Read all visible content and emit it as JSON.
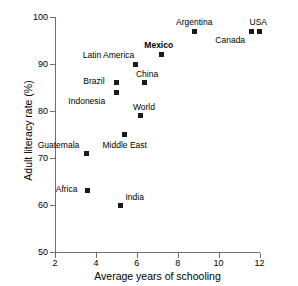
{
  "chart_data": {
    "type": "scatter",
    "title": "",
    "xlabel": "Average years of schooling",
    "ylabel": "Adult literacy rate (%)",
    "xlim": [
      2,
      12
    ],
    "ylim": [
      50,
      100
    ],
    "xticks": [
      2,
      4,
      6,
      8,
      10,
      12
    ],
    "yticks": [
      50,
      60,
      70,
      80,
      90,
      100
    ],
    "grid": false,
    "legend": null,
    "marker_color": "#1a1a1a",
    "axis_color": "#6e6e6e",
    "points": [
      {
        "label": "Argentina",
        "x": 8.8,
        "y": 97,
        "label_dx": -18,
        "label_dy": -13,
        "bold": false
      },
      {
        "label": "USA",
        "x": 12.0,
        "y": 97,
        "label_dx": -10,
        "label_dy": -13,
        "bold": false
      },
      {
        "label": "Canada",
        "x": 11.6,
        "y": 97,
        "label_dx": -36,
        "label_dy": 5,
        "bold": false
      },
      {
        "label": "Mexico",
        "x": 7.2,
        "y": 92,
        "label_dx": -17,
        "label_dy": -14,
        "bold": true
      },
      {
        "label": "Latin America",
        "x": 5.95,
        "y": 90,
        "label_dx": -53,
        "label_dy": -13,
        "bold": false
      },
      {
        "label": "China",
        "x": 6.4,
        "y": 86,
        "label_dx": -9,
        "label_dy": -13,
        "bold": false
      },
      {
        "label": "Brazil",
        "x": 5.0,
        "y": 86,
        "label_dx": -33,
        "label_dy": -6,
        "bold": false
      },
      {
        "label": "Indonesia",
        "x": 5.0,
        "y": 84,
        "label_dx": -48,
        "label_dy": 5,
        "bold": false
      },
      {
        "label": "World",
        "x": 6.2,
        "y": 79,
        "label_dx": -8,
        "label_dy": -13,
        "bold": false
      },
      {
        "label": "Middle East",
        "x": 5.4,
        "y": 75,
        "label_dx": -22,
        "label_dy": 6,
        "bold": false
      },
      {
        "label": "Guatemala",
        "x": 3.55,
        "y": 71,
        "label_dx": -49,
        "label_dy": -12,
        "bold": false
      },
      {
        "label": "Africa",
        "x": 3.6,
        "y": 63,
        "label_dx": -32,
        "label_dy": -6,
        "bold": false
      },
      {
        "label": "India",
        "x": 5.2,
        "y": 60,
        "label_dx": 5,
        "label_dy": -12,
        "bold": false
      }
    ]
  }
}
